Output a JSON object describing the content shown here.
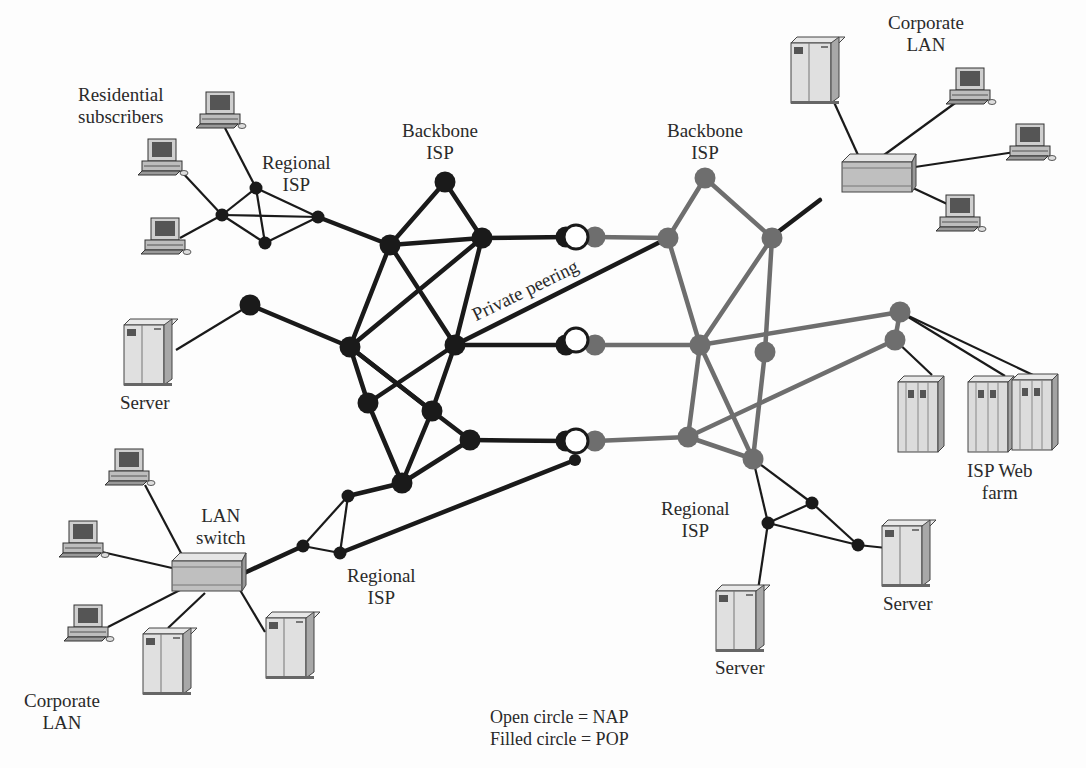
{
  "diagram": {
    "type": "network-topology",
    "labels": {
      "residential": [
        "Residential",
        "subscribers"
      ],
      "regional_isp_top_left": [
        "Regional",
        "ISP"
      ],
      "backbone_left": [
        "Backbone",
        "ISP"
      ],
      "backbone_right": [
        "Backbone",
        "ISP"
      ],
      "corporate_lan_top": [
        "Corporate",
        "LAN"
      ],
      "private_peering": "Private peering",
      "server_left": "Server",
      "isp_web_farm": [
        "ISP Web",
        "farm"
      ],
      "lan_switch": [
        "LAN",
        "switch"
      ],
      "regional_isp_bottom_left": [
        "Regional",
        "ISP"
      ],
      "regional_isp_bottom_right": [
        "Regional",
        "ISP"
      ],
      "server_bottom_middle": "Server",
      "server_bottom_right": "Server",
      "corporate_lan_bottom": [
        "Corporate",
        "LAN"
      ]
    },
    "legend": {
      "open_circle": "Open circle = NAP",
      "filled_circle": "Filled circle = POP"
    },
    "colors": {
      "left_backbone": "#1a1a1a",
      "right_backbone": "#6e6e6e",
      "nap_fill": "#ffffff",
      "device_body": "#d9d9d9"
    }
  }
}
